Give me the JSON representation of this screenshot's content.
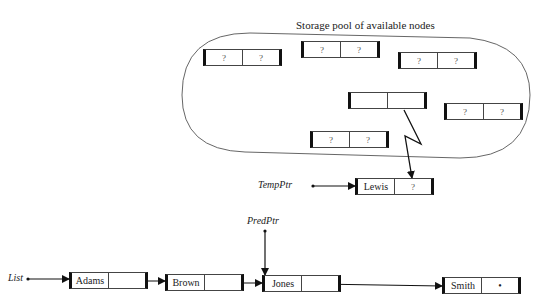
{
  "title": "Storage pool of available nodes",
  "pool_nodes": [
    {
      "id": "pool-node-1",
      "data": "?",
      "link": "?",
      "x": 203,
      "y": 49
    },
    {
      "id": "pool-node-2",
      "data": "?",
      "link": "?",
      "x": 301,
      "y": 41
    },
    {
      "id": "pool-node-3",
      "data": "?",
      "link": "?",
      "x": 398,
      "y": 52
    },
    {
      "id": "pool-node-4",
      "data": "",
      "link": "",
      "x": 348,
      "y": 92
    },
    {
      "id": "pool-node-5",
      "data": "?",
      "link": "?",
      "x": 444,
      "y": 103
    },
    {
      "id": "pool-node-6",
      "data": "?",
      "link": "?",
      "x": 310,
      "y": 131
    }
  ],
  "new_node": {
    "pointer_label": "TempPtr",
    "data": "Lewis",
    "link": "?"
  },
  "list": {
    "pointer_label": "List",
    "pred_pointer_label": "PredPtr",
    "nodes": [
      {
        "data": "Adams",
        "link": "•"
      },
      {
        "data": "Brown",
        "link": "•"
      },
      {
        "data": "Jones",
        "link": "•"
      },
      {
        "data": "Smith",
        "link": "•"
      }
    ]
  }
}
